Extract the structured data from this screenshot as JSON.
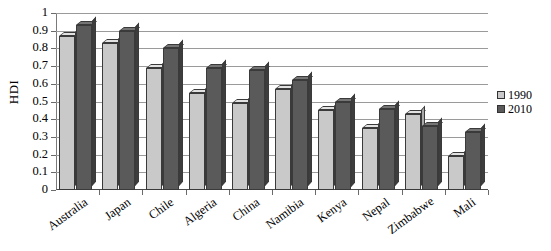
{
  "chart": {
    "type": "bar",
    "title": "",
    "ylabel": "HDI"
  },
  "legend": {
    "position": "right",
    "entries": [
      {
        "label": "1990",
        "color": "#c9c9c9",
        "icon": "legend-swatch-1990"
      },
      {
        "label": "2010",
        "color": "#5a5a5a",
        "icon": "legend-swatch-2010"
      }
    ]
  },
  "yaxis": {
    "ticks": [
      "1",
      "0.9",
      "0.8",
      "0.7",
      "0.6",
      "0.5",
      "0.4",
      "0.3",
      "0.2",
      "0.1",
      "0"
    ]
  },
  "chart_data": {
    "type": "bar",
    "title": "",
    "xlabel": "",
    "ylabel": "HDI",
    "ylim": [
      0,
      1
    ],
    "ytick_step": 0.1,
    "grid": true,
    "legend_position": "right",
    "categories": [
      "Australia",
      "Japan",
      "Chile",
      "Algeria",
      "China",
      "Namibia",
      "Kenya",
      "Nepal",
      "Zimbabwe",
      "Mali"
    ],
    "series": [
      {
        "name": "1990",
        "color": "#c9c9c9",
        "values": [
          0.87,
          0.83,
          0.69,
          0.55,
          0.49,
          0.57,
          0.45,
          0.35,
          0.43,
          0.19
        ]
      },
      {
        "name": "2010",
        "color": "#5a5a5a",
        "values": [
          0.93,
          0.9,
          0.8,
          0.69,
          0.68,
          0.62,
          0.5,
          0.46,
          0.36,
          0.33
        ]
      }
    ]
  }
}
